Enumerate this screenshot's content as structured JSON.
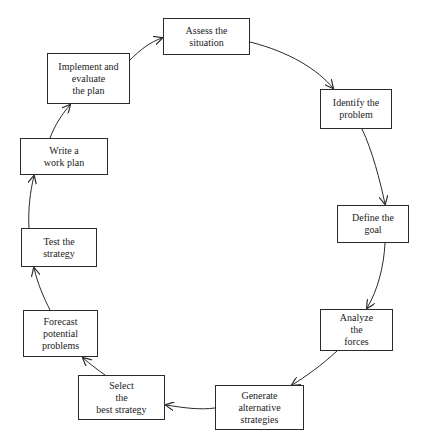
{
  "diagram": {
    "type": "cycle",
    "colors": {
      "line": "#2a2a2a",
      "text": "#222222",
      "background": "#ffffff"
    },
    "steps": [
      {
        "id": "assess",
        "lines": [
          "Assess the",
          "situation"
        ],
        "box": [
          163,
          18,
          87,
          37
        ]
      },
      {
        "id": "identify",
        "lines": [
          "Identify the",
          "problem"
        ],
        "box": [
          320,
          89,
          72,
          40
        ]
      },
      {
        "id": "define",
        "lines": [
          "Define the",
          "goal"
        ],
        "box": [
          337,
          205,
          72,
          38
        ]
      },
      {
        "id": "analyze",
        "lines": [
          "Analyze",
          "the",
          "forces"
        ],
        "box": [
          320,
          309,
          73,
          42
        ]
      },
      {
        "id": "generate",
        "lines": [
          "Generate",
          "alternative",
          "strategies"
        ],
        "box": [
          215,
          385,
          89,
          45
        ]
      },
      {
        "id": "select",
        "lines": [
          "Select",
          "the",
          "best strategy"
        ],
        "box": [
          78,
          375,
          87,
          45
        ]
      },
      {
        "id": "forecast",
        "lines": [
          "Forecast",
          "potential",
          "problems"
        ],
        "box": [
          23,
          310,
          75,
          47
        ]
      },
      {
        "id": "test",
        "lines": [
          "Test the",
          "strategy"
        ],
        "box": [
          21,
          228,
          76,
          39
        ]
      },
      {
        "id": "write",
        "lines": [
          "Write a",
          "work plan"
        ],
        "box": [
          20,
          138,
          88,
          37
        ]
      },
      {
        "id": "implement",
        "lines": [
          "Implement and",
          "evaluate",
          "the plan"
        ],
        "box": [
          47,
          53,
          83,
          51
        ]
      }
    ],
    "edges": [
      {
        "from": "assess",
        "to": "identify"
      },
      {
        "from": "identify",
        "to": "define"
      },
      {
        "from": "define",
        "to": "analyze"
      },
      {
        "from": "analyze",
        "to": "generate"
      },
      {
        "from": "generate",
        "to": "select"
      },
      {
        "from": "select",
        "to": "forecast"
      },
      {
        "from": "forecast",
        "to": "test"
      },
      {
        "from": "test",
        "to": "write"
      },
      {
        "from": "write",
        "to": "implement"
      },
      {
        "from": "implement",
        "to": "assess"
      }
    ]
  }
}
